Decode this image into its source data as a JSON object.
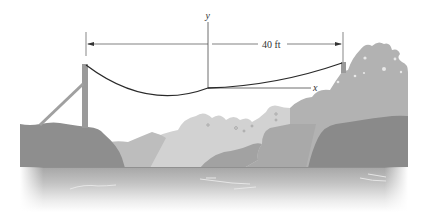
{
  "figure": {
    "type": "suspension-cable-diagram",
    "labels": {
      "y_axis": "y",
      "x_axis": "x",
      "span_dimension": "40 ft"
    },
    "colors": {
      "background": "#ffffff",
      "cable": "#2a2a2a",
      "dimension_line": "#4a4a4a",
      "tower": "#9a9a9a",
      "rock_dark": "#8c8c8c",
      "rock_mid": "#a8a8a8",
      "rock_light": "#c8c8c8",
      "rock_lightest": "#d6d6d6",
      "water_top": "#a9a9a9",
      "water_fade": "#ffffff"
    }
  }
}
